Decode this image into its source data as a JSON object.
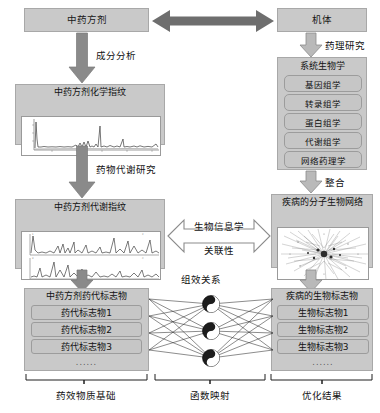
{
  "diagram": {
    "title_chain": "中药方剂—机体 系统生物学整合研究流程图",
    "left_column": {
      "formula_box": "中药方剂",
      "arrow1_label": "成分分析",
      "chem_fingerprint": "中药方剂化学指纹",
      "arrow2_label": "药物代谢研究",
      "metab_fingerprint": "中药方剂代谢指纹",
      "marker_panel_title": "中药方剂药代标志物",
      "markers": [
        "药代标志物1",
        "药代标志物2",
        "药代标志物3"
      ],
      "markers_ellipsis": "......",
      "bracket_label": "药效物质基础"
    },
    "middle_column": {
      "top_arrow": "bidirectional-arrow",
      "assoc_arrow_top_label": "生物信息学",
      "assoc_arrow_bottom_label": "关联性",
      "network_label": "组效关系",
      "bracket_label": "函数映射",
      "node_icon": "taiji-yinyang-icon",
      "node_count": 3
    },
    "right_column": {
      "organism_box": "机体",
      "arrow1_label": "药理研究",
      "systems_biology_title": "系统生物学",
      "omics": [
        "基因组学",
        "转录组学",
        "蛋白组学",
        "代谢组学",
        "网络药理学"
      ],
      "arrow2_label": "整合",
      "molecular_network": "疾病的分子生物网络",
      "biomarker_panel_title": "疾病的生物标志物",
      "biomarkers": [
        "生物标志物1",
        "生物标志物2",
        "生物标志物3"
      ],
      "biomarkers_ellipsis": "......",
      "bracket_label": "优化结果"
    },
    "colors": {
      "box_fill": "#c9c9c9",
      "box_border": "#a8a8a8",
      "arrow_dark": "#7a7a7a",
      "arrow_outline_stroke": "#8c8c8c",
      "top_arrow": "#6e6e6e",
      "plot_bg": "#ffffff",
      "text": "#111111"
    }
  }
}
